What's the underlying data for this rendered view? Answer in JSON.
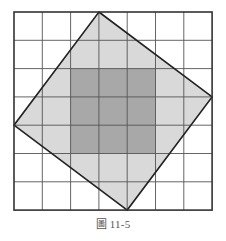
{
  "figure": {
    "caption": "圖 11-5",
    "grid": {
      "columns": 7,
      "rows": 7,
      "origin_px": [
        14,
        12
      ],
      "cell_px": 28.3,
      "line_color": "#555555",
      "border_color": "#333333"
    },
    "tilted_square": {
      "vertices_grid": [
        [
          3,
          0
        ],
        [
          7,
          3
        ],
        [
          4,
          7
        ],
        [
          0,
          4
        ]
      ],
      "fill": "#d9d9d9",
      "stroke": "#222222"
    },
    "inner_square": {
      "from_grid": [
        2,
        2
      ],
      "to_grid": [
        5,
        5
      ],
      "fill": "#a8a8a8"
    },
    "background": "#ffffff"
  }
}
